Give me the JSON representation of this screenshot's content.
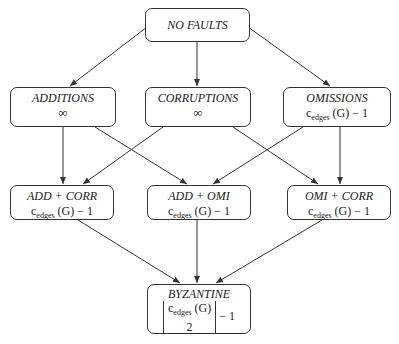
{
  "diagram": {
    "nodes": {
      "no_faults": {
        "title": "NO FAULTS",
        "value": ""
      },
      "additions": {
        "title": "ADDITIONS",
        "value": "∞"
      },
      "corruptions": {
        "title": "CORRUPTIONS",
        "value": "∞"
      },
      "omissions": {
        "title": "OMISSIONS",
        "value_base": "c",
        "value_sub": "edges",
        "value_rest": " (G) − 1"
      },
      "add_corr": {
        "title": "ADD + CORR",
        "value_base": "c",
        "value_sub": "edges",
        "value_rest": " (G) − 1"
      },
      "add_omi": {
        "title": "ADD + OMI",
        "value_base": "c",
        "value_sub": "edges",
        "value_rest": " (G) − 1"
      },
      "omi_corr": {
        "title": "OMI + CORR",
        "value_base": "c",
        "value_sub": "edges",
        "value_rest": " (G) − 1"
      },
      "byzantine": {
        "title": "BYZANTINE",
        "value_base": "c",
        "value_sub": "edges",
        "value_arg": " (G)",
        "denominator": "2",
        "value_rest": " − 1"
      }
    },
    "edges": [
      [
        "no_faults",
        "additions"
      ],
      [
        "no_faults",
        "corruptions"
      ],
      [
        "no_faults",
        "omissions"
      ],
      [
        "additions",
        "add_corr"
      ],
      [
        "additions",
        "add_omi"
      ],
      [
        "corruptions",
        "add_corr"
      ],
      [
        "corruptions",
        "omi_corr"
      ],
      [
        "omissions",
        "add_omi"
      ],
      [
        "omissions",
        "omi_corr"
      ],
      [
        "add_corr",
        "byzantine"
      ],
      [
        "add_omi",
        "byzantine"
      ],
      [
        "omi_corr",
        "byzantine"
      ]
    ]
  }
}
